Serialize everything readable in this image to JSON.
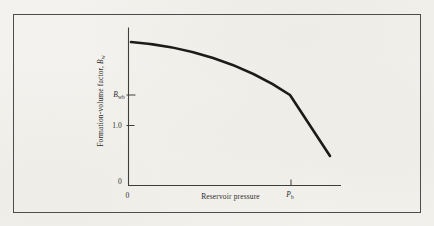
{
  "figure": {
    "type": "scanned textbook figure",
    "colors": {
      "paper": "#f4f2ee",
      "frame_border": "#4d4c4a",
      "axis": "#3f3e3b",
      "curve": "#1c1b19",
      "text": "#2e2d2a"
    }
  },
  "labels": {
    "y_prefix": "Formation-volume factor, ",
    "y_symbol": "B",
    "y_sub": "w",
    "ytick_bwb_base": "B",
    "ytick_bwb_sub": "wb",
    "ytick_10": "1.0",
    "ytick_0": "0",
    "xtick_0": "0",
    "xtick_pb_base": "P",
    "xtick_pb_sub": "b",
    "xlabel": "Reservoir pressure"
  },
  "chart_data": {
    "type": "line",
    "title": "",
    "xlabel": "Reservoir pressure",
    "ylabel": "Formation-volume factor, Bw",
    "x_tick_labels": [
      "0",
      "Pb"
    ],
    "y_tick_labels": [
      "0",
      "1.0",
      "Bwb"
    ],
    "legend": "none",
    "grid": false,
    "style": "schematic sketch, axes unscaled, single curve, kink at bubble point",
    "series": [
      {
        "name": "Bw vs reservoir pressure",
        "x_units": "pressure as fraction of bubble-point pressure Pb",
        "y_units": "formation volume factor (y tick 1.0 = 1.0)",
        "x": [
          0.02,
          0.27,
          0.52,
          0.77,
          1.0,
          1.24
        ],
        "y": [
          2.4,
          2.31,
          2.13,
          1.87,
          1.51,
          0.49
        ],
        "kink": {
          "x": 1.0,
          "y": 1.51,
          "label": "(Pb, Bwb)"
        },
        "shape": "gentle concave-down decline from p = 0 to the kink at (Pb, Bwb), then steep straight drop beyond Pb, ending below the 1.0 tick"
      }
    ]
  },
  "render": {
    "yaxis_path": "M128.5,27.5 V185.5",
    "xaxis_path": "M128,185.5 H341",
    "ytick_bwb_path": "M126.5,95 H135.5",
    "ytick_10_path": "M126.5,125.5 H134.5",
    "xtick_pb_path": "M291,185.5 V179.5",
    "curve_path": "M131,42 C185,46 243,63 290,95 L330,156"
  }
}
